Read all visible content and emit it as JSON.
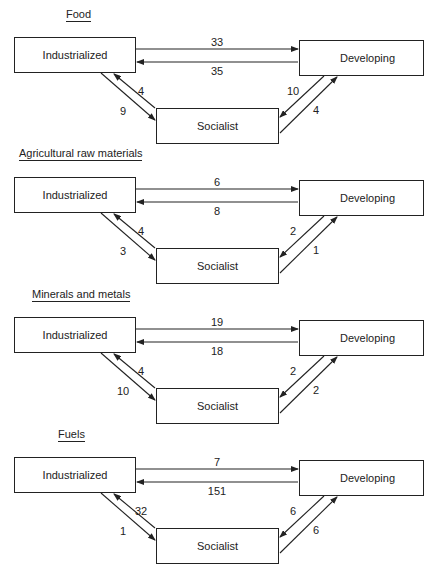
{
  "diagram": {
    "type": "trade-flow-diagram",
    "nodes": [
      "Industrialized",
      "Developing",
      "Socialist"
    ],
    "panels": [
      {
        "title": "Food",
        "industrialized_label": "Industrialized",
        "developing_label": "Developing",
        "socialist_label": "Socialist",
        "flows": {
          "industrialized_to_developing": "33",
          "developing_to_industrialized": "35",
          "socialist_to_industrialized": "4",
          "industrialized_to_socialist": "9",
          "developing_to_socialist": "10",
          "socialist_to_developing": "4"
        }
      },
      {
        "title": "Agricultural raw materials",
        "industrialized_label": "Industrialized",
        "developing_label": "Developing",
        "socialist_label": "Socialist",
        "flows": {
          "industrialized_to_developing": "6",
          "developing_to_industrialized": "8",
          "socialist_to_industrialized": "4",
          "industrialized_to_socialist": "3",
          "developing_to_socialist": "2",
          "socialist_to_developing": "1"
        }
      },
      {
        "title": "Minerals and metals",
        "industrialized_label": "Industrialized",
        "developing_label": "Developing",
        "socialist_label": "Socialist",
        "flows": {
          "industrialized_to_developing": "19",
          "developing_to_industrialized": "18",
          "socialist_to_industrialized": "4",
          "industrialized_to_socialist": "10",
          "developing_to_socialist": "2",
          "socialist_to_developing": "2"
        }
      },
      {
        "title": "Fuels",
        "industrialized_label": "Industrialized",
        "developing_label": "Developing",
        "socialist_label": "Socialist",
        "flows": {
          "industrialized_to_developing": "7",
          "developing_to_industrialized": "151",
          "socialist_to_industrialized": "32",
          "industrialized_to_socialist": "1",
          "developing_to_socialist": "6",
          "socialist_to_developing": "6"
        }
      }
    ]
  }
}
